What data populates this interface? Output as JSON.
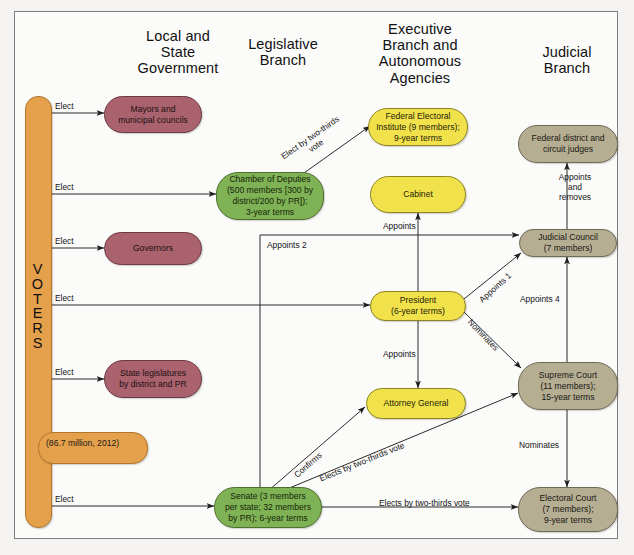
{
  "figure": {
    "title": "",
    "frame_color": "#7d7d7d",
    "background": "#fbfbfa"
  },
  "palette": {
    "voters_orange": "#e4a04a",
    "local_state_rose": "#a9626e",
    "legislative_green": "#7fb254",
    "executive_yellow": "#f1e24c",
    "judicial_taupe": "#b5ae93"
  },
  "columns": [
    {
      "id": "local-state",
      "label": "Local and\nState\nGovernment"
    },
    {
      "id": "legislative",
      "label": "Legislative\nBranch"
    },
    {
      "id": "executive",
      "label": "Executive\nBranch and\nAutonomous\nAgencies"
    },
    {
      "id": "judicial",
      "label": "Judicial\nBranch"
    }
  ],
  "voters": {
    "label_letters": [
      "V",
      "O",
      "T",
      "E",
      "R",
      "S"
    ],
    "label": "VOTERS",
    "population_note": "(86.7 million, 2012)"
  },
  "nodes": {
    "mayors": {
      "label": "Mayors and\nmunicipal councils",
      "color": "rose"
    },
    "governors": {
      "label": "Governors",
      "color": "rose"
    },
    "state_legislatures": {
      "label": "State legislatures\nby district and PR",
      "color": "rose"
    },
    "chamber": {
      "label": "Chamber of Deputies\n(500 members [300 by\ndistrict/200 by PR]);\n3-year terms",
      "color": "green"
    },
    "senate": {
      "label": "Senate (3 members\nper state; 32 members\nby PR); 6-year terms",
      "color": "green"
    },
    "ife": {
      "label": "Federal Electoral\nInstitute (9 members);\n9-year terms",
      "color": "yellow"
    },
    "cabinet": {
      "label": "Cabinet",
      "color": "yellow"
    },
    "president": {
      "label": "President\n(6-year terms)",
      "color": "yellow"
    },
    "attorney_general": {
      "label": "Attorney General",
      "color": "yellow"
    },
    "federal_judges": {
      "label": "Federal district and\ncircuit judges",
      "color": "taupe"
    },
    "judicial_council": {
      "label": "Judicial Council\n(7 members)",
      "color": "taupe"
    },
    "supreme_court": {
      "label": "Supreme Court\n(11 members);\n15-year terms",
      "color": "taupe"
    },
    "electoral_court": {
      "label": "Electoral Court\n(7 members);\n9-year terms",
      "color": "taupe"
    }
  },
  "edges": {
    "elect_mayors": {
      "label": "Elect",
      "from": "voters",
      "to": "mayors"
    },
    "elect_chamber": {
      "label": "Elect",
      "from": "voters",
      "to": "chamber"
    },
    "elect_governors": {
      "label": "Elect",
      "from": "voters",
      "to": "governors"
    },
    "elect_president": {
      "label": "Elect",
      "from": "voters",
      "to": "president"
    },
    "elect_state_legs": {
      "label": "Elect",
      "from": "voters",
      "to": "state_legislatures"
    },
    "elect_senate": {
      "label": "Elect",
      "from": "voters",
      "to": "senate"
    },
    "chamber_ife": {
      "label": "Elect by two-thirds\nvote",
      "from": "chamber",
      "to": "ife"
    },
    "president_cabinet": {
      "label": "Appoints",
      "from": "president",
      "to": "cabinet"
    },
    "president_ag": {
      "label": "Appoints",
      "from": "president",
      "to": "attorney_general"
    },
    "president_council": {
      "label": "Appoints 1",
      "from": "president",
      "to": "judicial_council"
    },
    "president_scourt": {
      "label": "Nominates",
      "from": "president",
      "to": "supreme_court"
    },
    "senate_council": {
      "label": "Appoints 2",
      "from": "senate",
      "to": "judicial_council"
    },
    "scourt_council": {
      "label": "Appoints 4",
      "from": "supreme_court",
      "to": "judicial_council"
    },
    "council_judges": {
      "label": "Appoints\nand\nremoves",
      "from": "judicial_council",
      "to": "federal_judges"
    },
    "scourt_ecourt": {
      "label": "Nominates",
      "from": "supreme_court",
      "to": "electoral_court"
    },
    "senate_ag": {
      "label": "Confirms",
      "from": "senate",
      "to": "attorney_general"
    },
    "senate_scourt": {
      "label": "Elects by two-thirds vote",
      "from": "senate",
      "to": "supreme_court"
    },
    "senate_ecourt": {
      "label": "Elects by two-thirds vote",
      "from": "senate",
      "to": "electoral_court"
    }
  }
}
